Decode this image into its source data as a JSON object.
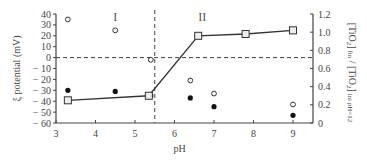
{
  "chart_data": {
    "type": "scatter",
    "title": "",
    "xlabel": "pH",
    "ylabel": "ξ potential (mV)",
    "y2label": "[TiO2]fin / [TiO2]ini pH=12",
    "xlim": [
      3,
      9.5
    ],
    "ylim": [
      -60,
      40
    ],
    "y2lim": [
      0,
      1.2
    ],
    "x_ticks": [
      3,
      4,
      5,
      6,
      7,
      8,
      9
    ],
    "y_ticks": [
      40,
      30,
      20,
      10,
      0,
      -10,
      -20,
      -30,
      -40,
      -50,
      -60
    ],
    "y_tick_labels": [
      "40",
      "30",
      "20",
      "10",
      "0",
      "− 10",
      "− 20",
      "− 30",
      "− 40",
      "− 50",
      "− 60"
    ],
    "y2_ticks": [
      1.2,
      1.0,
      0.8,
      0.6,
      0.4,
      0.2,
      0
    ],
    "y2_tick_labels": [
      "1.2",
      "1.0",
      "0.8",
      "0.6",
      "0.4",
      "0.2",
      "0"
    ],
    "grid": false,
    "annotations": [
      {
        "text": "I",
        "x": 4.5,
        "y": 35
      },
      {
        "text": "II",
        "x": 6.7,
        "y": 35
      },
      {
        "type": "vline",
        "x": 5.5,
        "style": "dashed"
      },
      {
        "type": "hline",
        "y": 0,
        "axis": "left",
        "style": "dashed"
      }
    ],
    "series": [
      {
        "name": "ξ potential (open circles)",
        "marker": "open-circle",
        "axis": "left",
        "x": [
          3.3,
          4.5,
          5.4,
          6.4,
          7.0,
          9.0
        ],
        "values": [
          35,
          25,
          -2,
          -21,
          -33,
          -43
        ]
      },
      {
        "name": "ξ potential (filled circles)",
        "marker": "filled-circle",
        "axis": "left",
        "x": [
          3.3,
          4.5,
          5.4,
          6.4,
          7.0,
          9.0
        ],
        "values": [
          -30,
          -31,
          -35,
          -37,
          -45,
          -53
        ]
      },
      {
        "name": "TiO2 ratio",
        "marker": "open-square",
        "line": true,
        "axis": "right",
        "x": [
          3.3,
          5.35,
          6.6,
          7.8,
          9.0
        ],
        "values": [
          0.25,
          0.3,
          0.96,
          0.98,
          1.02
        ]
      }
    ]
  }
}
